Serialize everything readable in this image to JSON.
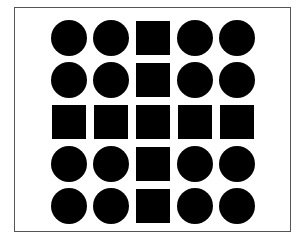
{
  "figure": {
    "frame": {
      "left": 14,
      "top": 7,
      "width": 277,
      "height": 225,
      "border_color": "#555555"
    },
    "fill_color": "#000000",
    "background": "#ffffff",
    "grid": {
      "rows": 5,
      "cols": 5,
      "origin_x": 51,
      "origin_y": 20,
      "pitch": 42,
      "cells": [
        [
          "circle",
          "circle",
          "square",
          "circle",
          "circle"
        ],
        [
          "circle",
          "circle",
          "square",
          "circle",
          "circle"
        ],
        [
          "square",
          "square",
          "square",
          "square",
          "square"
        ],
        [
          "circle",
          "circle",
          "square",
          "circle",
          "circle"
        ],
        [
          "circle",
          "circle",
          "square",
          "circle",
          "circle"
        ]
      ]
    }
  }
}
